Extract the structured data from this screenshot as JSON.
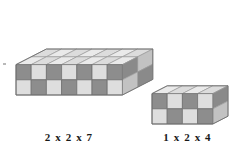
{
  "image": {
    "title": "Isometric cube block dimension comparison",
    "background_color": "#ffffff",
    "width": 238,
    "height": 156
  },
  "figures": [
    {
      "id": "left-block",
      "name": "large-block",
      "label": "2 x 2 x 7",
      "dims": {
        "depth": 2,
        "height": 2,
        "length": 7
      },
      "cube_count": 28,
      "origin": {
        "x": 16,
        "y": 95
      },
      "cube": {
        "w": 15.2,
        "h": 15.2,
        "iso_rise": 7.8
      }
    },
    {
      "id": "right-block",
      "name": "small-block",
      "label": "1 x 2 x 4",
      "dims": {
        "depth": 1,
        "height": 2,
        "length": 4
      },
      "cube_count": 8,
      "origin": {
        "x": 152,
        "y": 124
      },
      "cube": {
        "w": 15.2,
        "h": 15.2,
        "iso_rise": 7.8
      }
    }
  ],
  "palette": {
    "top_light": "#eaeaea",
    "top_shade": "#dcdcdc",
    "front_light": "#dedede",
    "front_dark": "#8d8d8d",
    "side_light": "#c2c2c2",
    "side_dark": "#8a8a8a",
    "edge": "#6f6f6f",
    "edge_soft": "#9a9a9a",
    "label_color": "#1a1a1a"
  },
  "labels": {
    "left": "2 x 2 x 7",
    "right": "1 x 2 x 4"
  },
  "artifacts": {
    "speck": {
      "x": 3,
      "y": 63,
      "w": 3,
      "h": 2
    }
  }
}
